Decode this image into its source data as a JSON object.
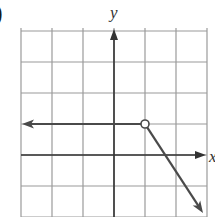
{
  "part_label": ")",
  "chart_data": {
    "type": "line",
    "title": "",
    "xlabel": "x",
    "ylabel": "y",
    "xlim": [
      -3,
      2.8
    ],
    "ylim": [
      -2,
      4
    ],
    "grid": true,
    "grid_step": 1,
    "series": [
      {
        "name": "left ray",
        "points": [
          [
            -3,
            1
          ],
          [
            1,
            1
          ]
        ],
        "start": "arrow",
        "end": "open-circle"
      },
      {
        "name": "right ray",
        "points": [
          [
            1,
            1
          ],
          [
            3,
            -2
          ]
        ],
        "start": "open-circle",
        "end": "arrow",
        "slope": -1.5
      }
    ],
    "annotations": [
      {
        "type": "open-circle",
        "x": 1,
        "y": 1
      }
    ]
  },
  "colors": {
    "grid": "#9a9a9a",
    "axis": "#333333",
    "curve": "#4a4a4a",
    "background": "#ffffff"
  }
}
